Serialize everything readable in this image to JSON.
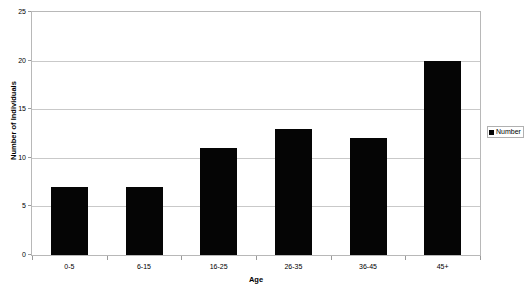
{
  "chart_data": {
    "type": "bar",
    "title": "",
    "categories": [
      "0-5",
      "6-15",
      "16-25",
      "26-35",
      "36-45",
      "45+"
    ],
    "values": [
      7,
      7,
      11,
      13,
      12,
      20
    ],
    "series": [
      {
        "name": "Number",
        "values": [
          7,
          7,
          11,
          13,
          12,
          20
        ]
      }
    ],
    "xlabel": "Age",
    "ylabel": "Number of Individuals",
    "ylim": [
      0,
      25
    ],
    "ytick_values": [
      0,
      5,
      10,
      15,
      20,
      25
    ],
    "ytick_labels": [
      "0",
      "5",
      "10",
      "15",
      "20",
      "25"
    ],
    "grid": true,
    "grid_axis": "y",
    "legend": {
      "position": "right",
      "entries": [
        {
          "label": "Number",
          "color": "#050505",
          "marker": "square"
        }
      ]
    },
    "colors": {
      "bar": "#050505",
      "gridline": "#c9c9c9",
      "plot_border": "#b8b8b8",
      "background": "#ffffff",
      "text": "#000000"
    }
  }
}
